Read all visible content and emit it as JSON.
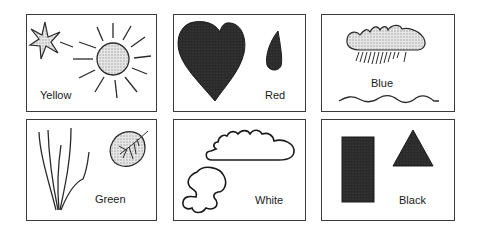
{
  "cards": [
    {
      "label": "Yellow",
      "shapes": [
        "star",
        "sun"
      ]
    },
    {
      "label": "Red",
      "shapes": [
        "heart",
        "drop"
      ]
    },
    {
      "label": "Blue",
      "shapes": [
        "rain-cloud",
        "wave"
      ]
    },
    {
      "label": "Green",
      "shapes": [
        "grass",
        "leaf"
      ]
    },
    {
      "label": "White",
      "shapes": [
        "cloud",
        "puddle"
      ]
    },
    {
      "label": "Black",
      "shapes": [
        "rectangle",
        "triangle"
      ]
    }
  ],
  "colors": {
    "stroke": "#2a2a2a",
    "fill_light": "#cfcfcf",
    "fill_dark": "#2a2a2a"
  }
}
